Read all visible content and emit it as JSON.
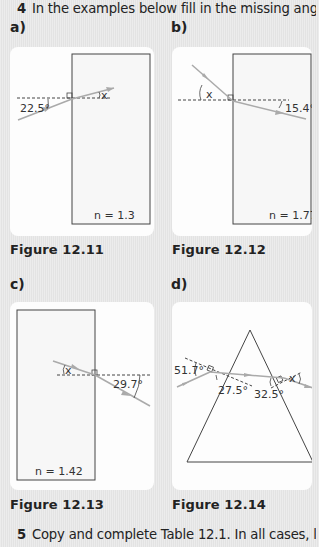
{
  "question4": {
    "number": "4",
    "text": "In the examples below fill in the missing angle x."
  },
  "parts": {
    "a": {
      "label": "a)",
      "caption": "Figure 12.11",
      "given_angle": "22.5°",
      "unknown": "x",
      "refractive_index": "n = 1.3"
    },
    "b": {
      "label": "b)",
      "caption": "Figure 12.12",
      "given_angle": "15.4°",
      "unknown": "x",
      "refractive_index": "n = 1.77"
    },
    "c": {
      "label": "c)",
      "caption": "Figure 12.13",
      "given_angle": "29.7°",
      "unknown": "x",
      "refractive_index": "n = 1.42"
    },
    "d": {
      "label": "d)",
      "caption": "Figure 12.14",
      "angle_1": "51.7°",
      "angle_2": "27.5°",
      "angle_3": "32.5°",
      "unknown": "x"
    }
  },
  "question5": {
    "number": "5",
    "text": "Copy and complete Table 12.1. In all cases, light is"
  },
  "colors": {
    "ray": "#a9a9a9",
    "outline": "#444444",
    "card": "#fdfdfd",
    "background": "#e6e6e6"
  }
}
